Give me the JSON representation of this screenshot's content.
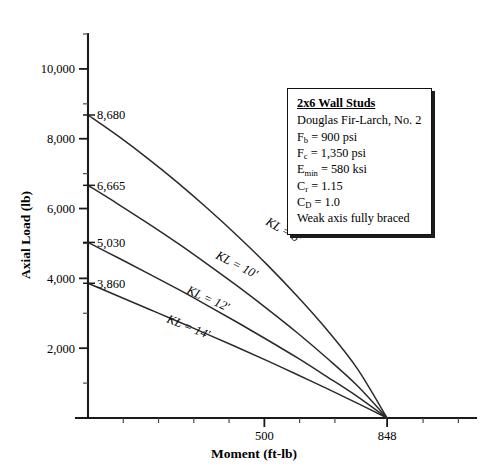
{
  "chart_data": {
    "type": "line",
    "title": "",
    "xlabel": "Moment (ft-lb)",
    "ylabel": "Axial Load (lb)",
    "xlim": [
      0,
      1100
    ],
    "ylim": [
      0,
      11000
    ],
    "grid": false,
    "legend_position": "inside-upper-right",
    "x_tick_labels": [
      {
        "value": 500,
        "label": "500"
      },
      {
        "value": 848,
        "label": "848"
      }
    ],
    "x_ticks_all": [
      0,
      100,
      200,
      300,
      400,
      500,
      600,
      700,
      848,
      950,
      1050
    ],
    "y_tick_labels": [
      {
        "value": 10000,
        "label": "10,000"
      },
      {
        "value": 8000,
        "label": "8,000"
      },
      {
        "value": 6000,
        "label": "6,000"
      },
      {
        "value": 4000,
        "label": "4,000"
      },
      {
        "value": 2000,
        "label": "2,000"
      }
    ],
    "y_minor_ticks": [
      1000,
      3000,
      5000,
      7000,
      9000,
      11000
    ],
    "axis_intercept_labels": [
      {
        "value": 8680,
        "label": "8,680",
        "series": "KL = 8'"
      },
      {
        "value": 6665,
        "label": "6,665",
        "series": "KL = 10'"
      },
      {
        "value": 5030,
        "label": "5,030",
        "series": "KL = 12'"
      },
      {
        "value": 3860,
        "label": "3,860",
        "series": "KL = 14'"
      }
    ],
    "convergence_point": {
      "x": 848,
      "y": 0
    },
    "series": [
      {
        "name": "KL = 8'",
        "label": "KL = 8'",
        "axial_intercept": 8680,
        "moment_intercept": 848,
        "points": [
          [
            0,
            8680
          ],
          [
            85,
            8080
          ],
          [
            170,
            7430
          ],
          [
            255,
            6735
          ],
          [
            339,
            6000
          ],
          [
            424,
            5215
          ],
          [
            509,
            4380
          ],
          [
            594,
            3480
          ],
          [
            678,
            2520
          ],
          [
            763,
            1420
          ],
          [
            848,
            0
          ]
        ]
      },
      {
        "name": "KL = 10'",
        "label": "KL = 10'",
        "axial_intercept": 6665,
        "moment_intercept": 848,
        "points": [
          [
            0,
            6665
          ],
          [
            85,
            6130
          ],
          [
            170,
            5575
          ],
          [
            255,
            5000
          ],
          [
            339,
            4400
          ],
          [
            424,
            3775
          ],
          [
            509,
            3120
          ],
          [
            594,
            2435
          ],
          [
            678,
            1710
          ],
          [
            763,
            930
          ],
          [
            848,
            0
          ]
        ]
      },
      {
        "name": "KL = 12'",
        "label": "KL = 12'",
        "axial_intercept": 5030,
        "moment_intercept": 848,
        "points": [
          [
            0,
            5030
          ],
          [
            85,
            4590
          ],
          [
            170,
            4145
          ],
          [
            255,
            3690
          ],
          [
            339,
            3220
          ],
          [
            424,
            2735
          ],
          [
            509,
            2235
          ],
          [
            594,
            1720
          ],
          [
            678,
            1180
          ],
          [
            763,
            620
          ],
          [
            848,
            0
          ]
        ]
      },
      {
        "name": "KL = 14'",
        "label": "KL = 14'",
        "axial_intercept": 3860,
        "moment_intercept": 848,
        "points": [
          [
            0,
            3860
          ],
          [
            85,
            3495
          ],
          [
            170,
            3130
          ],
          [
            255,
            2765
          ],
          [
            339,
            2395
          ],
          [
            424,
            2020
          ],
          [
            509,
            1635
          ],
          [
            594,
            1240
          ],
          [
            678,
            840
          ],
          [
            763,
            425
          ],
          [
            848,
            0
          ]
        ]
      }
    ]
  },
  "note_box": {
    "title": "2x6 Wall Studs",
    "lines": [
      "Douglas Fir-Larch, No. 2",
      "Weak axis fully braced"
    ],
    "properties": [
      {
        "symbol": "F",
        "sub": "b",
        "value": "= 900 psi"
      },
      {
        "symbol": "F",
        "sub": "c",
        "value": "= 1,350 psi"
      },
      {
        "symbol": "E",
        "sub": "min",
        "value": "= 580 ksi"
      },
      {
        "symbol": "C",
        "sub": "r",
        "value": "= 1.15"
      },
      {
        "symbol": "C",
        "sub": "D",
        "value": "= 1.0"
      }
    ]
  },
  "colors": {
    "axis": "#1a1a1a",
    "curve": "#2a2a2a",
    "background": "#ffffff",
    "text": "#000000"
  }
}
